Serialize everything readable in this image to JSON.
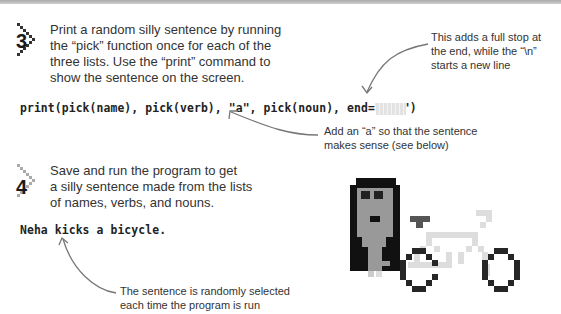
{
  "steps": [
    {
      "number": "3",
      "lines": [
        "Print a random silly sentence by running",
        "the “pick” function once for each of the",
        "three lists. Use the “print” command to",
        "show the sentence on the screen."
      ]
    },
    {
      "number": "4",
      "lines": [
        "Save and run the program to get",
        "a silly sentence made from the lists",
        "of names, verbs, and nouns."
      ]
    }
  ],
  "code": {
    "statement": "print(pick(name), pick(verb), \"a\", pick(noun), end=\".\\n\")",
    "output": "Neha kicks a bicycle."
  },
  "annotations": {
    "full_stop": [
      "This adds a full stop at",
      "the end, while the “\\n”",
      "starts a new line"
    ],
    "add_a": [
      "Add an “a” so that the sentence",
      "makes sense (see below)"
    ],
    "random": [
      "The sentence is randomly selected",
      "each time the program is run"
    ]
  },
  "illustration": {
    "subject": "pixel-art person with glasses next to a bicycle",
    "colors": {
      "hair": "#111111",
      "skin": "#999999",
      "bike_frame": "#dddddd",
      "bike_wheels": "#262626",
      "seat": "#555555"
    }
  },
  "colors": {
    "text": "#333333",
    "arrow": "#777777",
    "band": "#b5b5b5"
  }
}
